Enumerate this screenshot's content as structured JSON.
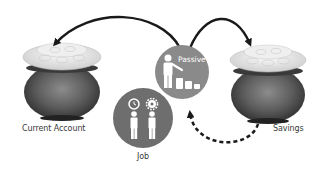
{
  "diagram": {
    "nodes": [
      {
        "id": "current-account",
        "label": "Current Account",
        "type": "pot"
      },
      {
        "id": "savings",
        "label": "Savings",
        "type": "pot"
      },
      {
        "id": "passive",
        "label": "Passive",
        "type": "circle-icon",
        "icon": "person-with-coin-stacks"
      },
      {
        "id": "job",
        "label": "Job",
        "type": "circle-icon",
        "icon": "two-persons-with-clock-and-gear"
      }
    ],
    "edges": [
      {
        "from": "passive",
        "to": "current-account",
        "style": "solid"
      },
      {
        "from": "passive",
        "to": "savings",
        "style": "solid"
      },
      {
        "from": "savings",
        "to": "passive",
        "style": "dashed"
      }
    ]
  },
  "labels": {
    "current_account": "Current Account",
    "savings": "Savings",
    "passive": "Passive",
    "job": "Job"
  },
  "colors": {
    "circle_fill": "#8a8a8a",
    "job_circle_fill": "#6b6b6b",
    "pot_body": "#5a5a5a",
    "coins": "#e8e8e8",
    "arrow": "#1a1a1a",
    "label_text": "#3a3a3a"
  }
}
